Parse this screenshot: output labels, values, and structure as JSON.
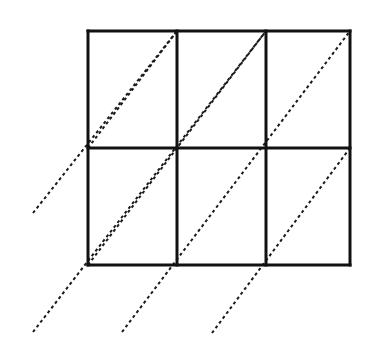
{
  "figure": {
    "type": "geometric-diagram",
    "canvas": {
      "width": 369,
      "height": 353,
      "background": "#ffffff"
    },
    "grid": {
      "label": "3 by 2 rectangle grid",
      "columns": 3,
      "rows": 2,
      "left": 88,
      "right": 350,
      "top": 31,
      "bottom": 265,
      "stroke_color": "#111111",
      "stroke_width": 3,
      "vertical_x": [
        88,
        177,
        266,
        350
      ],
      "horizontal_y": [
        31,
        148,
        265
      ],
      "cell_width": 87,
      "cell_height": 117
    },
    "diagonals": {
      "label": "Dashed parallel lines of slope one",
      "stroke_color": "#1a1a1a",
      "stroke_width": 2,
      "dash_pattern": "3 3",
      "count": 6,
      "direction": "lower-left to upper-right",
      "lines": [
        {
          "name": "diagonal-1",
          "x1": 33,
          "y1": 213,
          "x2": 177,
          "y2": 31
        },
        {
          "name": "diagonal-2",
          "x1": 33,
          "y1": 332,
          "x2": 266,
          "y2": 31
        },
        {
          "name": "diagonal-3",
          "x1": 122,
          "y1": 332,
          "x2": 350,
          "y2": 31
        },
        {
          "name": "diagonal-4",
          "x1": 212,
          "y1": 333,
          "x2": 350,
          "y2": 148
        },
        {
          "name": "diagonal-5",
          "x1": 88,
          "y1": 148,
          "x2": 177,
          "y2": 31
        },
        {
          "name": "diagonal-6",
          "x1": 88,
          "y1": 265,
          "x2": 266,
          "y2": 31
        }
      ]
    }
  }
}
